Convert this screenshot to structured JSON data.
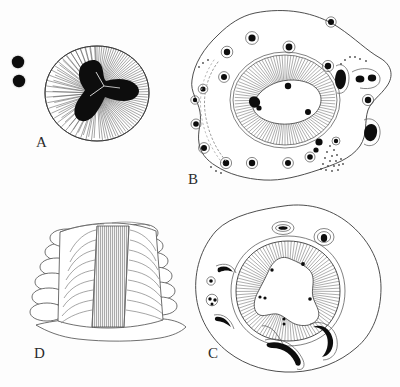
{
  "figure": {
    "background_color": "#fdfdfd",
    "ink_color": "#2b2b2b",
    "dark_inclusion_color": "#0d0d0d",
    "width": 400,
    "height": 387
  },
  "panels": [
    {
      "id": "A",
      "label": "A",
      "label_x": 36,
      "label_y": 147,
      "description": "Rounded body with dense radiating striations surrounding a dark tri-lobed central mass; two small dark spheres lie outside to the left.",
      "body": {
        "center_x": 97,
        "center_y": 93,
        "radius_x": 52,
        "radius_y": 47,
        "striation_count": 120
      },
      "central_mass": {
        "shape": "tri-lobed",
        "lobes": 3,
        "fill": "#0d0d0d"
      },
      "satellites": [
        {
          "cx": 18,
          "cy": 62,
          "r": 7
        },
        {
          "cx": 19,
          "cy": 80,
          "r": 7
        }
      ]
    },
    {
      "id": "B",
      "label": "B",
      "label_x": 188,
      "label_y": 184,
      "description": "Large irregular cell outline containing a central oval ring of radiating striations around a pale lumen; numerous haloed dark granules are scattered in the surrounding matrix, with a stippled arc on the left and a stippled triangular patch at lower right.",
      "central_ring": {
        "center_x": 285,
        "center_y": 100,
        "radius_x": 52,
        "radius_y": 45,
        "striation_count": 140
      },
      "granule_count": 24,
      "stipple_features": [
        "left-arc-chain",
        "lower-right-triangle",
        "right-margin-dots"
      ]
    },
    {
      "id": "C",
      "label": "C",
      "label_x": 208,
      "label_y": 358,
      "description": "Irregular rounded body with a thick ring of radiating striations around a star-shaped pale lumen; crescent-shaped dark inclusions and haloed oval granules occupy the outer matrix.",
      "central_ring": {
        "center_x": 288,
        "center_y": 291,
        "radius_x": 52,
        "radius_y": 50,
        "striation_count": 140
      },
      "lumen_shape": "stellate",
      "crescent_count": 4,
      "granule_count": 6
    },
    {
      "id": "D",
      "label": "D",
      "label_x": 34,
      "label_y": 358,
      "description": "Three-dimensional block showing a longitudinal section: a dark vertically hatched median band flanked by symmetric sets of curved lamellae that project as rounded lobes along both margins.",
      "band": {
        "orientation": "vertical",
        "hatch_spacing": 2
      },
      "lamella_pairs": 8
    }
  ],
  "legend": {
    "panel_order": [
      "A",
      "B",
      "C",
      "D"
    ],
    "note": "Panel letters appear at the lower-left of each figure."
  }
}
